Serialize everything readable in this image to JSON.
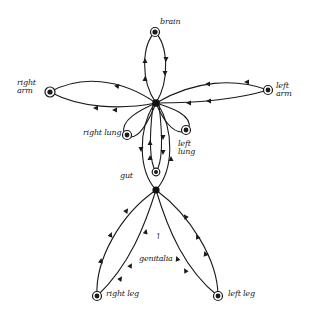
{
  "diagram": {
    "type": "flow-diagram",
    "nodes": [
      {
        "id": "brain",
        "label": "brain",
        "x": 155,
        "y": 32
      },
      {
        "id": "right_arm",
        "label": "right\narm",
        "x": 50,
        "y": 92
      },
      {
        "id": "left_arm",
        "label": "left\narm",
        "x": 268,
        "y": 90
      },
      {
        "id": "center_hub",
        "label": "",
        "x": 156,
        "y": 103
      },
      {
        "id": "right_lung",
        "label": "right lung",
        "x": 127,
        "y": 135
      },
      {
        "id": "left_lung",
        "label": "left\nlung",
        "x": 186,
        "y": 130
      },
      {
        "id": "gut",
        "label": "gut",
        "x": 156,
        "y": 172
      },
      {
        "id": "lower_hub",
        "label": "",
        "x": 156,
        "y": 190
      },
      {
        "id": "genitalia",
        "label": "genitalia",
        "x": 156,
        "y": 244
      },
      {
        "id": "right_leg",
        "label": "right leg",
        "x": 97,
        "y": 296
      },
      {
        "id": "left_leg",
        "label": "left leg",
        "x": 218,
        "y": 296
      }
    ],
    "labels": {
      "brain": "brain",
      "right_arm": "right\narm",
      "left_arm": "left\narm",
      "right_lung": "right lung",
      "left_lung": "left\nlung",
      "gut": "gut",
      "genitalia": "genitalia",
      "genitalia_arrow": "↑",
      "right_leg": "right leg",
      "left_leg": "left leg"
    },
    "edges": [
      {
        "from": "center_hub",
        "to": "brain",
        "loop": true
      },
      {
        "from": "center_hub",
        "to": "right_arm",
        "loop": true
      },
      {
        "from": "center_hub",
        "to": "left_arm",
        "loop": true
      },
      {
        "from": "center_hub",
        "to": "right_lung",
        "loop": true
      },
      {
        "from": "center_hub",
        "to": "left_lung",
        "loop": true
      },
      {
        "from": "center_hub",
        "to": "gut",
        "loop": true
      },
      {
        "from": "center_hub",
        "to": "lower_hub",
        "loop": true
      },
      {
        "from": "lower_hub",
        "to": "right_leg",
        "loop": true
      },
      {
        "from": "lower_hub",
        "to": "left_leg",
        "loop": true
      }
    ],
    "colors": {
      "ink": "#1a1a1a",
      "background": "#ffffff"
    }
  }
}
